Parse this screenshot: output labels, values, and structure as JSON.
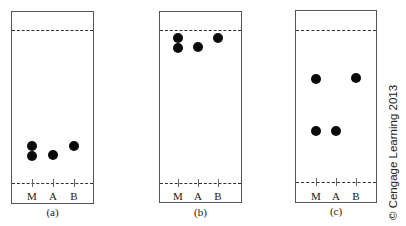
{
  "plates": [
    {
      "id": "a",
      "caption": "(a)",
      "box": {
        "x": 11,
        "y": 11,
        "w": 83,
        "h": 193
      },
      "solvent_front_y": 30,
      "baseline_y": 183,
      "label_y": 190,
      "caption_y": 206,
      "lanes": [
        {
          "label": "M",
          "x": 32
        },
        {
          "label": "A",
          "x": 53
        },
        {
          "label": "B",
          "x": 74
        }
      ],
      "spots": [
        {
          "lane": "M",
          "x": 32,
          "y": 146
        },
        {
          "lane": "M",
          "x": 32,
          "y": 156
        },
        {
          "lane": "A",
          "x": 53,
          "y": 155
        },
        {
          "lane": "B",
          "x": 74,
          "y": 146
        }
      ]
    },
    {
      "id": "b",
      "caption": "(b)",
      "box": {
        "x": 159,
        "y": 11,
        "w": 83,
        "h": 192
      },
      "solvent_front_y": 30,
      "baseline_y": 183,
      "label_y": 190,
      "caption_y": 206,
      "lanes": [
        {
          "label": "M",
          "x": 178
        },
        {
          "label": "A",
          "x": 198
        },
        {
          "label": "B",
          "x": 218
        }
      ],
      "spots": [
        {
          "lane": "M",
          "x": 178,
          "y": 38
        },
        {
          "lane": "M",
          "x": 178,
          "y": 48
        },
        {
          "lane": "A",
          "x": 198,
          "y": 47
        },
        {
          "lane": "B",
          "x": 218,
          "y": 38
        }
      ]
    },
    {
      "id": "c",
      "caption": "(c)",
      "box": {
        "x": 295,
        "y": 10,
        "w": 82,
        "h": 193
      },
      "solvent_front_y": 30,
      "baseline_y": 182,
      "label_y": 190,
      "caption_y": 205,
      "lanes": [
        {
          "label": "M",
          "x": 316
        },
        {
          "label": "A",
          "x": 336
        },
        {
          "label": "B",
          "x": 356
        }
      ],
      "spots": [
        {
          "lane": "M",
          "x": 316,
          "y": 79
        },
        {
          "lane": "M",
          "x": 316,
          "y": 131
        },
        {
          "lane": "A",
          "x": 336,
          "y": 131
        },
        {
          "lane": "B",
          "x": 356,
          "y": 78
        }
      ]
    }
  ],
  "copyright": "© Cengage Learning 2013",
  "colors": {
    "spot": "#0a0a0a",
    "border": "#555555",
    "dash": "#333333",
    "background": "#ffffff"
  }
}
